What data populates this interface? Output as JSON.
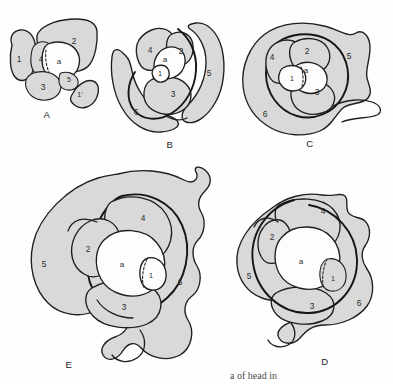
{
  "figure": {
    "background_color": "#fefefe",
    "fill_color": "#d9d9d9",
    "line_color": "#1f1f1f",
    "white_core_color": "#fdfdfd",
    "panels": [
      {
        "id": "A",
        "letter": "A",
        "letter_pos": {
          "x": 47,
          "y": 115
        },
        "center_label": "a",
        "center_label_pos": {
          "x": 59,
          "y": 62
        },
        "labels": [
          {
            "text": "1",
            "x": 19,
            "y": 60
          },
          {
            "text": "2",
            "x": 74,
            "y": 42
          },
          {
            "text": "4",
            "x": 41,
            "y": 60
          },
          {
            "text": "3",
            "x": 43,
            "y": 88
          },
          {
            "text": "5",
            "x": 69,
            "y": 80
          },
          {
            "text": "1'",
            "x": 80,
            "y": 95
          }
        ]
      },
      {
        "id": "B",
        "letter": "B",
        "letter_pos": {
          "x": 170,
          "y": 145
        },
        "center_label": "a",
        "center_label_pos": {
          "x": 165,
          "y": 60
        },
        "labels": [
          {
            "text": "4",
            "x": 150,
            "y": 51
          },
          {
            "text": "2",
            "x": 181,
            "y": 52
          },
          {
            "text": "1",
            "x": 160,
            "y": 74
          },
          {
            "text": "5",
            "x": 209,
            "y": 74
          },
          {
            "text": "3",
            "x": 173,
            "y": 95
          },
          {
            "text": "6",
            "x": 136,
            "y": 113
          }
        ]
      },
      {
        "id": "C",
        "letter": "C",
        "letter_pos": {
          "x": 310,
          "y": 144
        },
        "center_label": "a",
        "center_label_pos": {
          "x": 306,
          "y": 71
        },
        "labels": [
          {
            "text": "2",
            "x": 307,
            "y": 52
          },
          {
            "text": "4",
            "x": 272,
            "y": 58
          },
          {
            "text": "5",
            "x": 349,
            "y": 57
          },
          {
            "text": "1",
            "x": 292,
            "y": 79
          },
          {
            "text": "3",
            "x": 317,
            "y": 93
          },
          {
            "text": "6",
            "x": 265,
            "y": 115
          }
        ]
      },
      {
        "id": "D",
        "letter": "D",
        "letter_pos": {
          "x": 325,
          "y": 362
        },
        "center_label": "a",
        "center_label_pos": {
          "x": 301,
          "y": 262
        },
        "labels": [
          {
            "text": "4",
            "x": 323,
            "y": 212
          },
          {
            "text": "2",
            "x": 272,
            "y": 238
          },
          {
            "text": "5",
            "x": 249,
            "y": 277
          },
          {
            "text": "1",
            "x": 333,
            "y": 279
          },
          {
            "text": "3",
            "x": 312,
            "y": 307
          },
          {
            "text": "6",
            "x": 359,
            "y": 304
          }
        ]
      },
      {
        "id": "E",
        "letter": "E",
        "letter_pos": {
          "x": 69,
          "y": 365
        },
        "center_label": "a",
        "center_label_pos": {
          "x": 122,
          "y": 265
        },
        "labels": [
          {
            "text": "4",
            "x": 143,
            "y": 219
          },
          {
            "text": "2",
            "x": 88,
            "y": 250
          },
          {
            "text": "5",
            "x": 44,
            "y": 265
          },
          {
            "text": "1",
            "x": 151,
            "y": 276
          },
          {
            "text": "6",
            "x": 180,
            "y": 283
          },
          {
            "text": "3",
            "x": 124,
            "y": 308
          }
        ]
      }
    ],
    "caption_fragment": "a of head in"
  }
}
